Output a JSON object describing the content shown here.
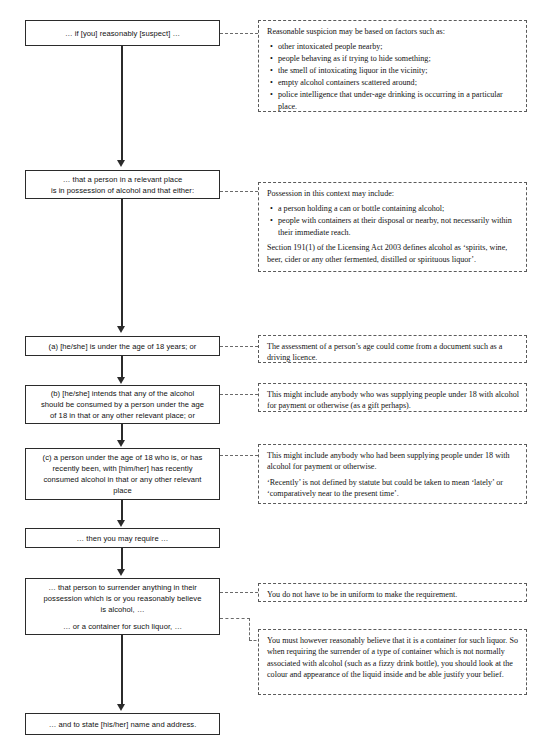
{
  "flow": {
    "boxes": [
      {
        "id": "suspect",
        "lines": [
          "… if [you] reasonably [suspect] …"
        ]
      },
      {
        "id": "possession",
        "lines": [
          "… that a person in a relevant place",
          "is in possession of alcohol and that either:"
        ]
      },
      {
        "id": "age",
        "lines": [
          "(a) [he/she] is under the age of 18 years; or"
        ]
      },
      {
        "id": "intends",
        "lines": [
          "(b) [he/she] intends that any of the alcohol",
          "should be consumed by a person under the age",
          "of 18 in that or any other relevant place; or"
        ]
      },
      {
        "id": "consumed",
        "lines": [
          "(c) a person under the age of 18 who is, or has",
          "recently been, with [him/her] has recently",
          "consumed alcohol in that or any other relevant",
          "place"
        ]
      },
      {
        "id": "require",
        "lines": [
          "… then you may require …"
        ]
      },
      {
        "id": "surrender",
        "lines": [
          "… that person to surrender anything in their",
          "possession which is or you reasonably believe",
          "is alcohol, …",
          "… or a container for such liquor, …"
        ]
      },
      {
        "id": "name-address",
        "lines": [
          "… and to state [his/her] name and address."
        ]
      }
    ]
  },
  "notes": [
    {
      "id": "reasonable-suspicion",
      "intro": "Reasonable suspicion may be based on factors such as:",
      "bullets": [
        "other intoxicated people nearby;",
        "people behaving as if trying to hide something;",
        "the smell of intoxicating liquor in the vicinity;",
        "empty alcohol containers scattered around;",
        "police intelligence that under-age drinking is occurring in a particular place."
      ],
      "paragraphs": []
    },
    {
      "id": "possession",
      "intro": "Possession in this context may include:",
      "bullets": [
        "a person holding a can or bottle containing alcohol;",
        "people with containers at their disposal or nearby, not necessarily within their immediate reach."
      ],
      "paragraphs": [
        "Section 191(1) of the Licensing Act 2003 defines alcohol as ‘spirits, wine, beer, cider or any other fermented, distilled or spirituous liquor’."
      ]
    },
    {
      "id": "age-assessment",
      "intro": "",
      "bullets": [],
      "paragraphs": [
        "The assessment of a person’s age could come from a document such as a driving licence."
      ]
    },
    {
      "id": "intends-supply",
      "intro": "",
      "bullets": [],
      "paragraphs": [
        "This might include anybody who was supplying people under 18 with alcohol for payment or otherwise (as a gift perhaps)."
      ]
    },
    {
      "id": "recently-consumed",
      "intro": "",
      "bullets": [],
      "paragraphs": [
        "This might include anybody who had been supplying people under 18 with alcohol for payment or otherwise.",
        "‘Recently’ is not defined by statute but could be taken to mean ‘lately’ or ‘comparatively near to the present time’."
      ]
    },
    {
      "id": "uniform",
      "intro": "",
      "bullets": [],
      "paragraphs": [
        "You do not have to be in uniform to make the requirement."
      ]
    },
    {
      "id": "container-belief",
      "intro": "",
      "bullets": [],
      "paragraphs": [
        "You must however reasonably believe that it is a container for such liquor. So when requiring the surrender of a type of container which is not normally associated with alcohol (such as a fizzy drink bottle), you should look at the colour and appearance of the liquid inside and be able justify your belief."
      ]
    }
  ]
}
